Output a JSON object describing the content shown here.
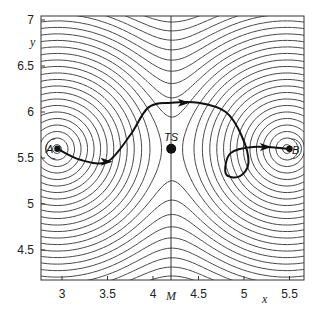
{
  "chart_data": {
    "type": "contour",
    "title": "",
    "xlabel": "x",
    "ylabel": "y",
    "xlim": [
      2.8,
      5.65
    ],
    "ylim": [
      4.05,
      7.05
    ],
    "x_ticks": [
      "3",
      "3.5",
      "4",
      "4.5",
      "5",
      "5.5"
    ],
    "x_tick_values": [
      3,
      3.5,
      4,
      4.5,
      5,
      5.5
    ],
    "y_ticks": [
      "4.5",
      "5",
      "5.5",
      "6",
      "6.5",
      "7"
    ],
    "y_tick_values": [
      4.5,
      5,
      5.5,
      6,
      6.5,
      7
    ],
    "special_x_tick": {
      "label": "M",
      "value": 4.2
    },
    "vertical_line_at_x": 4.2,
    "grid": false,
    "points": [
      {
        "label": "A",
        "x": 2.95,
        "y": 5.6
      },
      {
        "label": "TS",
        "x": 4.2,
        "y": 5.6
      },
      {
        "label": "B",
        "x": 5.5,
        "y": 5.6
      }
    ],
    "trajectory": {
      "description": "Reaction path from minimum A over saddle region to minimum B with a loop near B",
      "approx_points": [
        [
          2.95,
          5.6
        ],
        [
          3.2,
          5.48
        ],
        [
          3.5,
          5.46
        ],
        [
          3.75,
          5.75
        ],
        [
          3.95,
          6.05
        ],
        [
          4.2,
          6.1
        ],
        [
          4.5,
          6.1
        ],
        [
          4.8,
          6.0
        ],
        [
          4.97,
          5.75
        ],
        [
          5.05,
          5.45
        ],
        [
          4.95,
          5.3
        ],
        [
          4.8,
          5.33
        ],
        [
          4.85,
          5.55
        ],
        [
          5.1,
          5.62
        ],
        [
          5.5,
          5.6
        ]
      ],
      "arrows_at": [
        [
          3.5,
          5.46
        ],
        [
          4.35,
          6.1
        ],
        [
          5.25,
          5.62
        ]
      ]
    },
    "contour_levels": 34
  },
  "labels": {
    "x_axis": "x",
    "y_axis": "y",
    "m_tick": "M",
    "point_a": "A",
    "point_ts": "TS",
    "point_b": "B"
  }
}
